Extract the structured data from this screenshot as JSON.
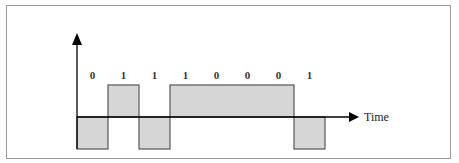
{
  "diagram": {
    "title": "",
    "axis_label_x": "Time",
    "bits": [
      "0",
      "1",
      "1",
      "1",
      "0",
      "0",
      "0",
      "1"
    ],
    "signal_levels": [
      "low",
      "high",
      "low",
      "high",
      "high",
      "high",
      "high",
      "low"
    ],
    "colors": {
      "pulse_fill": "#d6d6d6",
      "pulse_stroke": "#555555",
      "axis": "#000000",
      "frame": "#9a9a9a"
    }
  }
}
